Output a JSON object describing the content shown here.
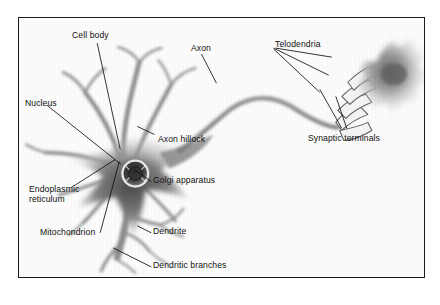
{
  "figure": {
    "style": "grayscale pencil / airbrush illustration with black leader lines",
    "frame": {
      "border_color": "#1d1d1d",
      "background_color": "#fbfbfb"
    },
    "page_background": "#ffffff",
    "label_color": "#111111"
  },
  "labels": [
    {
      "id": "cell-body",
      "text": "Cell body",
      "x": 71,
      "y": 29
    },
    {
      "id": "axon",
      "text": "Axon",
      "x": 190,
      "y": 42
    },
    {
      "id": "telodendria",
      "text": "Telodendria",
      "x": 274,
      "y": 38
    },
    {
      "id": "nucleus",
      "text": "Nucleus",
      "x": 24,
      "y": 97
    },
    {
      "id": "axon-hillock",
      "text": "Axon hillock",
      "x": 157,
      "y": 133
    },
    {
      "id": "synaptic-terminals",
      "text": "Synaptic terminals",
      "x": 307,
      "y": 132
    },
    {
      "id": "endoplasmic-reticulum",
      "text": "Endoplasmic\nreticulum",
      "x": 28,
      "y": 188
    },
    {
      "id": "golgi-apparatus",
      "text": "Golgi apparatus",
      "x": 152,
      "y": 181
    },
    {
      "id": "mitochondrion",
      "text": "Mitochondrion",
      "x": 39,
      "y": 233
    },
    {
      "id": "dendrite",
      "text": "Dendrite",
      "x": 152,
      "y": 232
    },
    {
      "id": "dendritic-branches",
      "text": "Dendritic branches",
      "x": 152,
      "y": 266
    }
  ],
  "leader_lines": [
    {
      "id": "leader-cell-body",
      "from": [
        95,
        40
      ],
      "to": [
        119,
        148
      ]
    },
    {
      "id": "leader-axon",
      "from": [
        200,
        53
      ],
      "to": [
        215,
        82
      ]
    },
    {
      "id": "leader-telodendria-a",
      "from": [
        272,
        47
      ],
      "to": [
        327,
        74
      ]
    },
    {
      "id": "leader-telodendria-b",
      "from": [
        276,
        47
      ],
      "to": [
        330,
        56
      ]
    },
    {
      "id": "leader-telodendria-c",
      "from": [
        274,
        48
      ],
      "to": [
        318,
        91
      ]
    },
    {
      "id": "leader-nucleus",
      "from": [
        46,
        104
      ],
      "to": [
        112,
        155
      ]
    },
    {
      "id": "leader-axon-hillock",
      "from": [
        153,
        133
      ],
      "to": [
        135,
        125
      ]
    },
    {
      "id": "leader-synaptic-a",
      "from": [
        340,
        127
      ],
      "to": [
        318,
        88
      ]
    },
    {
      "id": "leader-synaptic-b",
      "from": [
        345,
        127
      ],
      "to": [
        334,
        95
      ]
    },
    {
      "id": "leader-er",
      "from": [
        70,
        186
      ],
      "to": [
        113,
        158
      ]
    },
    {
      "id": "leader-golgi",
      "from": [
        150,
        180
      ],
      "to": [
        133,
        168
      ]
    },
    {
      "id": "leader-mitochondrion",
      "from": [
        99,
        231
      ],
      "to": [
        118,
        160
      ]
    },
    {
      "id": "leader-dendrite",
      "from": [
        150,
        231
      ],
      "to": [
        136,
        224
      ]
    },
    {
      "id": "leader-dendritic-branches",
      "from": [
        150,
        265
      ],
      "to": [
        112,
        246
      ]
    }
  ],
  "structures": {
    "soma": {
      "name": "cell-body-soma",
      "center": [
        118,
        152
      ],
      "note": "dark star-shaped cell body"
    },
    "nucleus": {
      "name": "nucleus",
      "center": [
        116,
        155
      ],
      "radius": 13
    },
    "axon": {
      "name": "axon",
      "note": "long S-curved fiber from hillock to telodendria"
    },
    "target_cell": {
      "name": "target-cell",
      "center": [
        372,
        62
      ],
      "note": "grey star-shaped postsynaptic cell"
    },
    "dendrites_up": 4,
    "dendrites_down": 3
  }
}
